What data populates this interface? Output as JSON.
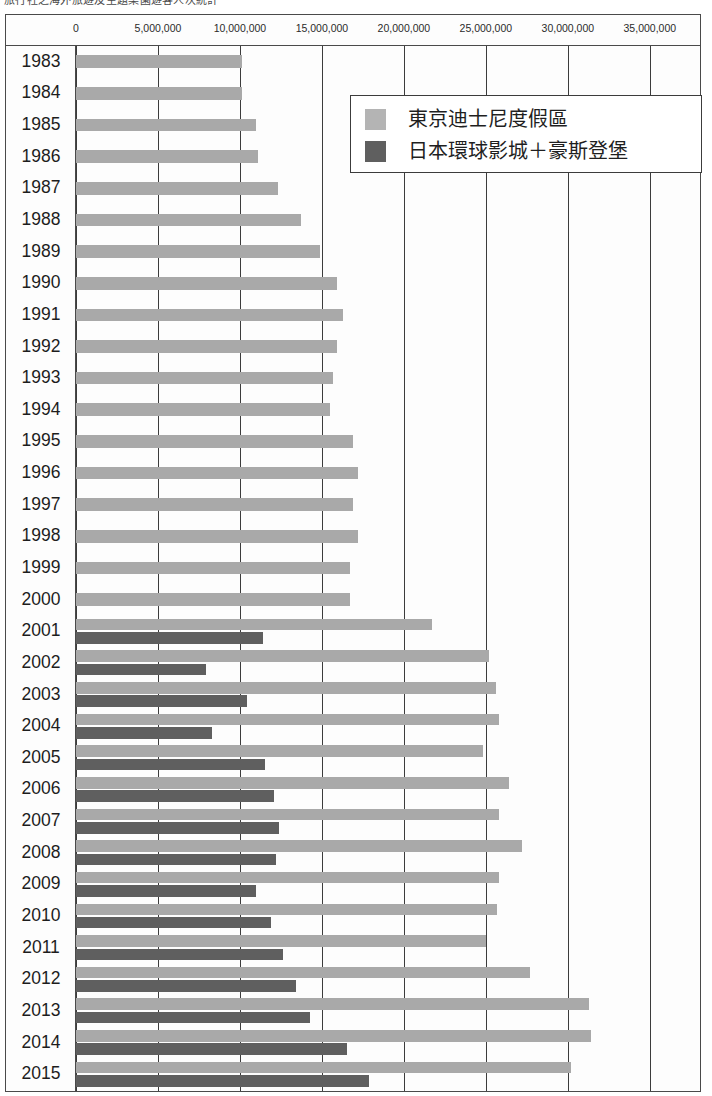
{
  "caption": "旅行社之海外旅遊及主題樂園遊客人次統計",
  "legend": {
    "position": "top-right",
    "items": [
      {
        "label": "東京迪士尼度假區",
        "color": "#b4b4b4",
        "key": "tokyo_disney_resort"
      },
      {
        "label": "日本環球影城＋豪斯登堡",
        "color": "#5f5f5f",
        "key": "usj_plus_huis_ten_bosch"
      }
    ]
  },
  "axis": {
    "tick_labels": [
      "0",
      "5,000,000",
      "10,000,000",
      "15,000,000",
      "20,000,000",
      "25,000,000",
      "30,000,000",
      "35,000,000"
    ],
    "tick_values": [
      0,
      5000000,
      10000000,
      15000000,
      20000000,
      25000000,
      30000000,
      35000000
    ]
  },
  "chart_data": {
    "type": "bar",
    "orientation": "horizontal",
    "title": "",
    "subtitle": "",
    "xlabel": "",
    "ylabel": "",
    "xlim": [
      0,
      38000000
    ],
    "grid": true,
    "legend_position": "top-right",
    "categories": [
      "1983",
      "1984",
      "1985",
      "1986",
      "1987",
      "1988",
      "1989",
      "1990",
      "1991",
      "1992",
      "1993",
      "1994",
      "1995",
      "1996",
      "1997",
      "1998",
      "1999",
      "2000",
      "2001",
      "2002",
      "2003",
      "2004",
      "2005",
      "2006",
      "2007",
      "2008",
      "2009",
      "2010",
      "2011",
      "2012",
      "2013",
      "2014",
      "2015"
    ],
    "series": [
      {
        "name": "東京迪士尼度假區",
        "color": "#a9a9a9",
        "values": [
          10100000,
          10100000,
          11000000,
          11100000,
          12300000,
          13700000,
          14900000,
          15900000,
          16300000,
          15900000,
          15700000,
          15500000,
          16900000,
          17200000,
          16900000,
          17200000,
          16700000,
          16700000,
          21700000,
          25200000,
          25600000,
          25800000,
          24800000,
          26400000,
          25800000,
          27200000,
          25800000,
          25700000,
          25000000,
          27700000,
          31300000,
          31400000,
          30200000
        ]
      },
      {
        "name": "日本環球影城＋豪斯登堡",
        "color": "#5f5f5f",
        "values": [
          0,
          0,
          0,
          0,
          0,
          0,
          0,
          0,
          0,
          0,
          0,
          0,
          0,
          0,
          0,
          0,
          0,
          0,
          11400000,
          7900000,
          10400000,
          8300000,
          11500000,
          12100000,
          12400000,
          12200000,
          11000000,
          11900000,
          12600000,
          13400000,
          14300000,
          16500000,
          17900000
        ]
      }
    ]
  }
}
